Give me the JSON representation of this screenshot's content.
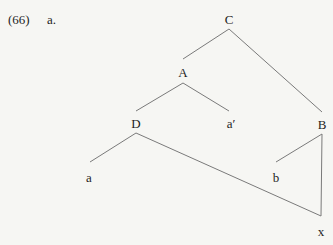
{
  "example": {
    "number": "(66)",
    "sub_label": "a."
  },
  "tree": {
    "nodes": [
      {
        "id": "C",
        "label": "C",
        "x": 229,
        "y": 19
      },
      {
        "id": "A",
        "label": "A",
        "x": 183,
        "y": 72
      },
      {
        "id": "B",
        "label": "B",
        "x": 322,
        "y": 124
      },
      {
        "id": "D",
        "label": "D",
        "x": 136,
        "y": 123
      },
      {
        "id": "a_prime",
        "label": "a′",
        "x": 231,
        "y": 123
      },
      {
        "id": "a",
        "label": "a",
        "x": 89,
        "y": 177
      },
      {
        "id": "b",
        "label": "b",
        "x": 276,
        "y": 177
      },
      {
        "id": "x",
        "label": "x",
        "x": 321,
        "y": 231
      }
    ],
    "edges": [
      {
        "from": "C",
        "to": "A",
        "x1": 229,
        "y1": 29,
        "x2": 183,
        "y2": 59
      },
      {
        "from": "C",
        "to": "B",
        "x1": 229,
        "y1": 29,
        "x2": 322,
        "y2": 112
      },
      {
        "from": "A",
        "to": "D",
        "x1": 183,
        "y1": 83,
        "x2": 136,
        "y2": 111
      },
      {
        "from": "A",
        "to": "a_prime",
        "x1": 183,
        "y1": 83,
        "x2": 229,
        "y2": 111
      },
      {
        "from": "D",
        "to": "a",
        "x1": 136,
        "y1": 133,
        "x2": 90,
        "y2": 162
      },
      {
        "from": "D",
        "to": "x",
        "x1": 136,
        "y1": 133,
        "x2": 321,
        "y2": 216
      },
      {
        "from": "B",
        "to": "b",
        "x1": 322,
        "y1": 134,
        "x2": 276,
        "y2": 162
      },
      {
        "from": "B",
        "to": "x",
        "x1": 322,
        "y1": 134,
        "x2": 321,
        "y2": 216
      }
    ]
  },
  "colors": {
    "background": "#f6f6f3",
    "text": "#1e1e1e",
    "edge": "#7a7a7a"
  }
}
